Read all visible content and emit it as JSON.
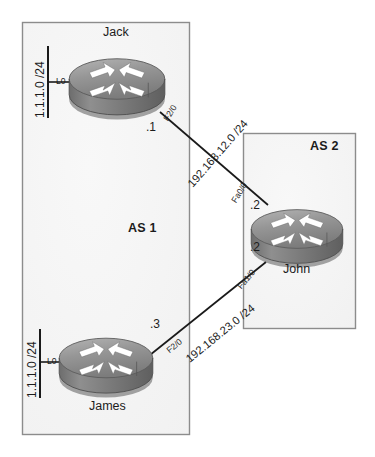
{
  "diagram": {
    "background_color": "#ffffff",
    "zone_fill": "#f6f6f6",
    "zone_border": "#8c8c8c",
    "link_color": "#1a1a1a",
    "router_body_color": "#7d7d7d",
    "router_top_color": "#999999",
    "arrow_color": "#ffffff"
  },
  "zones": [
    {
      "id": "as1",
      "label": "AS 1"
    },
    {
      "id": "as2",
      "label": "AS 2"
    }
  ],
  "routers": [
    {
      "id": "jack",
      "name": "Jack",
      "icon": "router-icon"
    },
    {
      "id": "james",
      "name": "James",
      "icon": "router-icon"
    },
    {
      "id": "john",
      "name": "John",
      "icon": "router-icon"
    }
  ],
  "loopbacks": [
    {
      "id": "jack-lo",
      "interface": "L0",
      "network": "1.1.1.0 /24"
    },
    {
      "id": "james-lo",
      "interface": "L0",
      "network": "1.1.1.0 /24"
    }
  ],
  "links": [
    {
      "id": "jack-john",
      "network": "192.168.12.0 /24",
      "a_interface": "F2/0",
      "a_address": ".1",
      "b_interface": "Fa0/0",
      "b_address": ".2"
    },
    {
      "id": "james-john",
      "network": "192.168.23.0 /24",
      "a_interface": "F2/0",
      "a_address": ".3",
      "b_interface": "Fa1/0",
      "b_address": ".2"
    }
  ]
}
